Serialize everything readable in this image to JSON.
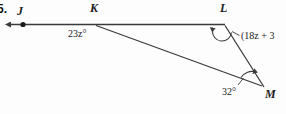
{
  "figure": {
    "problem_number": "5.",
    "points": {
      "j": "J",
      "k": "K",
      "l": "L",
      "m": "M"
    },
    "angles": {
      "at_k": "23z°",
      "at_l": "(18z + 3",
      "at_m": "32°"
    },
    "colors": {
      "stroke": "#3a3a3a",
      "text": "#1b1b1b",
      "background": "#fdfdfd"
    }
  }
}
